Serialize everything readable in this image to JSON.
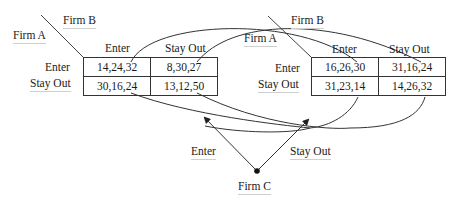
{
  "diagram": {
    "type": "three-player normal form game",
    "matrices": [
      {
        "row_player": "Firm A",
        "col_player": "Firm B",
        "col_labels": [
          "Enter",
          "Stay Out"
        ],
        "row_labels": [
          "Enter",
          "Stay Out"
        ],
        "cells": [
          [
            "14,24,32",
            "8,30,27"
          ],
          [
            "30,16,24",
            "13,12,50"
          ]
        ]
      },
      {
        "row_player": "Firm A",
        "col_player": "Firm B",
        "col_labels": [
          "Enter",
          "Stay Out"
        ],
        "row_labels": [
          "Enter",
          "Stay Out"
        ],
        "cells": [
          [
            "16,26,30",
            "31,16,24"
          ],
          [
            "31,23,14",
            "14,26,32"
          ]
        ]
      }
    ],
    "chooser": {
      "name": "Firm C",
      "branches": [
        "Enter",
        "Stay Out"
      ]
    }
  }
}
